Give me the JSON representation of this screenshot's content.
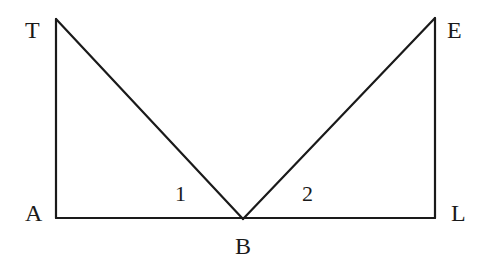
{
  "diagram": {
    "points": {
      "T": {
        "label": "T",
        "x": 56,
        "y": 19
      },
      "A": {
        "label": "A",
        "x": 56,
        "y": 218
      },
      "B": {
        "label": "B",
        "x": 243,
        "y": 219
      },
      "E": {
        "label": "E",
        "x": 435,
        "y": 18
      },
      "L": {
        "label": "L",
        "x": 435,
        "y": 218
      }
    },
    "segments": [
      {
        "from": "T",
        "to": "A"
      },
      {
        "from": "A",
        "to": "L"
      },
      {
        "from": "T",
        "to": "B"
      },
      {
        "from": "B",
        "to": "E"
      },
      {
        "from": "E",
        "to": "L"
      }
    ],
    "angle_labels": {
      "angle1": "1",
      "angle2": "2"
    },
    "colors": {
      "stroke": "#1a1a1a",
      "background": "#ffffff"
    }
  }
}
